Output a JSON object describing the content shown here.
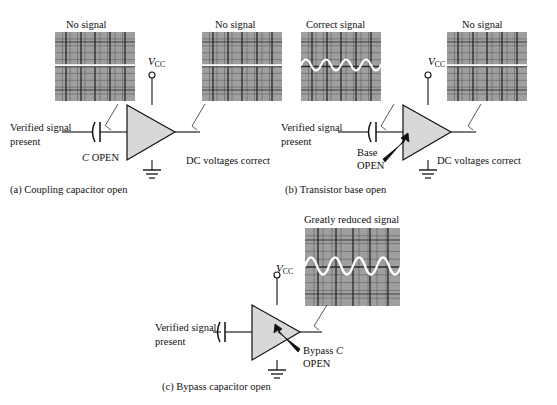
{
  "figure": {
    "ink_color": "#111111",
    "scope_bg": "#9b9b9b",
    "scope_grid": "#3a3a3a",
    "trace_color": "#ffffff",
    "triangle_fill": "#d8d8d8"
  },
  "panels": [
    {
      "id": "a",
      "caption": "(a) Coupling capacitor open",
      "input_label_line1": "Verified signal",
      "input_label_line2": "present",
      "component_label_italic": "C",
      "component_label_rest": " OPEN",
      "supply_label_v": "V",
      "supply_label_sub": "CC",
      "amp_text_line1": "Faulty",
      "amp_text_line2": "stage",
      "output_note": "DC voltages correct",
      "scopes": [
        {
          "title": "No signal",
          "trace": "flat",
          "cycles": 0,
          "amplitude": 0
        },
        {
          "title": "No signal",
          "trace": "flat",
          "cycles": 0,
          "amplitude": 0
        }
      ]
    },
    {
      "id": "b",
      "caption": "(b) Transistor base open",
      "input_label_line1": "Verified signal",
      "input_label_line2": "present",
      "fault_label_line1": "Base",
      "fault_label_line2": "OPEN",
      "supply_label_v": "V",
      "supply_label_sub": "CC",
      "amp_text_line1": "Faulty",
      "amp_text_line2": "stage",
      "output_note": "DC voltages correct",
      "scopes": [
        {
          "title": "Correct signal",
          "trace": "sine",
          "cycles": 4,
          "amplitude": 11
        },
        {
          "title": "No signal",
          "trace": "flat",
          "cycles": 0,
          "amplitude": 0
        }
      ]
    },
    {
      "id": "c",
      "caption": "(c) Bypass capacitor open",
      "input_label_line1": "Verified signal",
      "input_label_line2": "present",
      "fault_label_line1_a": "Bypass ",
      "fault_label_line1_b": "C",
      "fault_label_line2": "OPEN",
      "supply_label_v": "V",
      "supply_label_sub": "CC",
      "amp_text_line1": "Faulty",
      "amp_text_line2": "stage",
      "scopes": [
        {
          "title": "Greatly reduced signal",
          "trace": "sine",
          "cycles": 4,
          "amplitude": 17
        }
      ]
    }
  ]
}
